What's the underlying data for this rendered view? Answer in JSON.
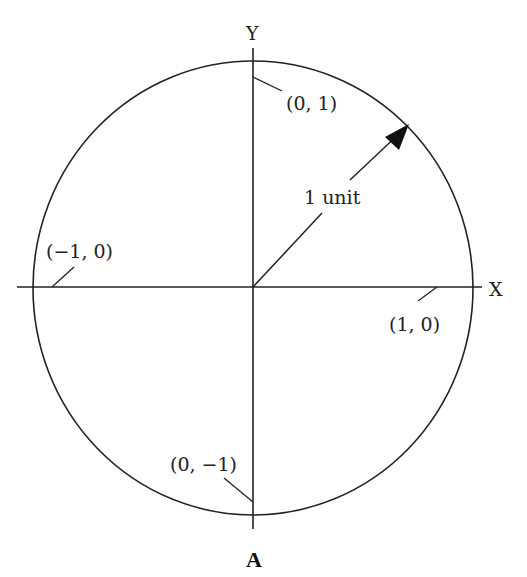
{
  "diagram": {
    "caption": "A",
    "axes": {
      "x_label": "X",
      "y_label": "Y"
    },
    "points": [
      {
        "label": "(0, 1)"
      },
      {
        "label": "(−1, 0)"
      },
      {
        "label": "(1, 0)"
      },
      {
        "label": "(0, −1)"
      }
    ],
    "radius_label": "1 unit",
    "colors": {
      "stroke": "#222222",
      "background": "#ffffff"
    }
  }
}
